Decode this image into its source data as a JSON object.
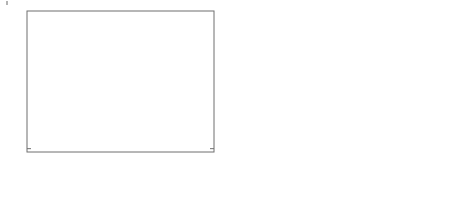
{
  "figure": {
    "panels": [
      {
        "id": "a",
        "caption": "(a)",
        "xlabel": "Gene1",
        "categories": [
          "control",
          "case"
        ],
        "yticks": [
          -3,
          -2,
          -1,
          0,
          1,
          2,
          3
        ],
        "ytick_labels": [
          "-3",
          "-2",
          "-1",
          "0",
          "1",
          "2",
          "3"
        ],
        "ylim": [
          -3.15,
          3.2
        ]
      },
      {
        "id": "b",
        "caption": "(b)",
        "xlabel": "Gene2",
        "categories": [
          "control",
          "case"
        ],
        "yticks": [
          -3,
          -2,
          -1,
          0,
          1,
          2,
          3
        ],
        "ytick_labels": [
          "-3",
          "-2",
          "-1",
          "0",
          "1",
          "2",
          "3"
        ],
        "ylim": [
          -3.65,
          3.8
        ]
      }
    ]
  },
  "chart_data": [
    {
      "type": "box",
      "title": "",
      "xlabel": "Gene1",
      "ylabel": "",
      "caption": "(a)",
      "categories": [
        "control",
        "case"
      ],
      "ylim": [
        -3.15,
        3.2
      ],
      "yticks": [
        -3,
        -2,
        -1,
        0,
        1,
        2,
        3
      ],
      "grid": false,
      "legend": "none",
      "boxes": [
        {
          "label": "control",
          "whisker_low": -2.7,
          "q1": -0.72,
          "median": -0.08,
          "q3": 0.73,
          "whisker_high": 2.75,
          "outliers": []
        },
        {
          "label": "case",
          "whisker_low": -2.3,
          "q1": -0.25,
          "median": 0.42,
          "q3": 1.18,
          "whisker_high": 3.05,
          "outliers": [
            -2.52,
            -2.62
          ]
        }
      ]
    },
    {
      "type": "box",
      "title": "",
      "xlabel": "Gene2",
      "ylabel": "",
      "caption": "(b)",
      "categories": [
        "control",
        "case"
      ],
      "ylim": [
        -3.65,
        3.8
      ],
      "yticks": [
        -3,
        -2,
        -1,
        0,
        1,
        2,
        3
      ],
      "grid": false,
      "legend": "none",
      "boxes": [
        {
          "label": "control",
          "whisker_low": -3.2,
          "q1": -1.0,
          "median": -0.15,
          "q3": 0.55,
          "whisker_high": 2.9,
          "outliers": []
        },
        {
          "label": "case",
          "whisker_low": -2.1,
          "q1": -0.6,
          "median": 0.15,
          "q3": 1.0,
          "whisker_high": 2.85,
          "outliers": [
            3.6
          ]
        }
      ]
    }
  ],
  "colors": {
    "axis": "#6f6f6f",
    "box_outline": "#7b7b7b",
    "median": "#4a4a4a",
    "text": "#2b2b2b",
    "background": "#ffffff"
  }
}
